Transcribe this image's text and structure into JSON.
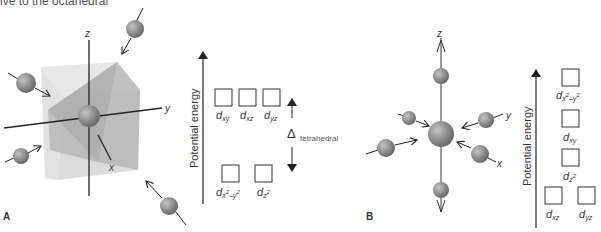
{
  "caption_fragment": "ive to the octahedral",
  "panel_a": {
    "label": "A",
    "geometry": "tetrahedral",
    "axes": {
      "x": "x",
      "y": "y",
      "z": "z"
    },
    "energy_axis_label": "Potential energy",
    "upper_orbitals": [
      "d_xy",
      "d_xz",
      "d_yz"
    ],
    "lower_orbitals": [
      "d_x2-y2",
      "d_z2"
    ],
    "splitting_symbol": "Δ",
    "splitting_label": "tetrahedral"
  },
  "panel_b": {
    "label": "B",
    "geometry": "octahedral",
    "axes": {
      "x": "x",
      "y": "y",
      "z": "z"
    },
    "energy_axis_label": "Potential energy",
    "orbital_levels": [
      [
        "d_x2-y2"
      ],
      [
        "d_xy"
      ],
      [
        "d_z2"
      ],
      [
        "d_xz",
        "d_yz"
      ]
    ]
  },
  "colors": {
    "sphere": "#8c8c8c",
    "cube_fill": "#d9d9d9",
    "octahedron_fill": "#b3b3b3",
    "line": "#222222"
  }
}
